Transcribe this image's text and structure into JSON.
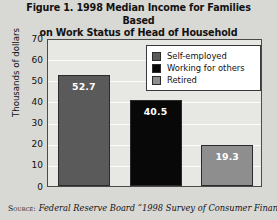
{
  "figure": {
    "title_line1": "Figure 1.  1998 Median Income for Families Based",
    "title_line2": "on Work Status of Head of Household",
    "source_label": "Source:",
    "source_text": " Federal Reserve Board “1998 Survey of Consumer Finances.”"
  },
  "chart_data": {
    "type": "bar",
    "title": "Figure 1.  1998 Median Income for Families Based on Work Status of Head of Household",
    "xlabel": "",
    "ylabel": "Thousands of dollars",
    "ylim": [
      0,
      70
    ],
    "ytick_step": 10,
    "yticks": [
      "70",
      "60",
      "50",
      "40",
      "30",
      "20",
      "10",
      "0"
    ],
    "grid": true,
    "legend_position": "top-right",
    "categories": [
      "Self-employed",
      "Working for others",
      "Retired"
    ],
    "values": [
      52.7,
      40.5,
      19.3
    ],
    "value_labels": [
      "52.7",
      "40.5",
      "19.3"
    ],
    "colors": [
      "#5a5a5a",
      "#080808",
      "#8e8e8e"
    ],
    "series": [
      {
        "name": "Self-employed",
        "value": 52.7,
        "label": "52.7",
        "color": "#5a5a5a"
      },
      {
        "name": "Working for others",
        "value": 40.5,
        "label": "40.5",
        "color": "#080808"
      },
      {
        "name": "Retired",
        "value": 19.3,
        "label": "19.3",
        "color": "#8e8e8e"
      }
    ]
  },
  "legend": {
    "items": [
      {
        "label": "Self-employed",
        "color": "#5a5a5a"
      },
      {
        "label": "Working for others",
        "color": "#080808"
      },
      {
        "label": "Retired",
        "color": "#8e8e8e"
      }
    ]
  }
}
